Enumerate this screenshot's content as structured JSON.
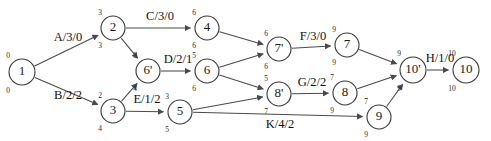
{
  "diagram": {
    "stroke_color": "#4a4a4a",
    "node_stroke_color": "#3a3a3a",
    "background_color": "#ffffff",
    "nodes": [
      {
        "id": "n1",
        "label": "1",
        "early": "0",
        "late": "0",
        "cx": 22,
        "cy": 72,
        "r": 13
      },
      {
        "id": "n2",
        "label": "2",
        "early": "3",
        "late": "3",
        "cx": 113,
        "cy": 28,
        "r": 12
      },
      {
        "id": "n3",
        "label": "3",
        "early": "2",
        "late": "4",
        "cx": 113,
        "cy": 111,
        "r": 12
      },
      {
        "id": "n6p",
        "label": "6'",
        "early": "3",
        "late": "4",
        "cx": 148,
        "cy": 71,
        "r": 12
      },
      {
        "id": "n4",
        "label": "4",
        "early": "6",
        "late": "6",
        "cx": 207,
        "cy": 28,
        "r": 12
      },
      {
        "id": "n6",
        "label": "6",
        "early": "5",
        "late": "6",
        "cx": 207,
        "cy": 71,
        "r": 12
      },
      {
        "id": "n5",
        "label": "5",
        "early": "3",
        "late": "5",
        "cx": 180,
        "cy": 112,
        "r": 12
      },
      {
        "id": "n7p",
        "label": "7'",
        "early": "6",
        "late": "6",
        "cx": 279,
        "cy": 49,
        "r": 12
      },
      {
        "id": "n8p",
        "label": "8'",
        "early": "5",
        "late": "7",
        "cx": 279,
        "cy": 94,
        "r": 12
      },
      {
        "id": "n7",
        "label": "7",
        "early": "9",
        "late": "9",
        "cx": 347,
        "cy": 45,
        "r": 12
      },
      {
        "id": "n8",
        "label": "8",
        "early": "7",
        "late": "9",
        "cx": 345,
        "cy": 93,
        "r": 12
      },
      {
        "id": "n9",
        "label": "9",
        "early": "7",
        "late": "9",
        "cx": 379,
        "cy": 117,
        "r": 12
      },
      {
        "id": "n10p",
        "label": "10'",
        "early": "9",
        "late": "9",
        "cx": 413,
        "cy": 70,
        "r": 13
      },
      {
        "id": "n10",
        "label": "10",
        "early": "10",
        "late": "10",
        "cx": 466,
        "cy": 70,
        "r": 13
      }
    ],
    "edges": [
      {
        "id": "e-a",
        "from": "n1",
        "to": "n2",
        "label": "A/3/0",
        "lx": 68,
        "ly": 41
      },
      {
        "id": "e-b",
        "from": "n1",
        "to": "n3",
        "label": "B/2/2",
        "lx": 68,
        "ly": 99
      },
      {
        "id": "e-c",
        "from": "n2",
        "to": "n4",
        "label": "C/3/0",
        "lx": 160,
        "ly": 20
      },
      {
        "id": "e-2-6p",
        "from": "n2",
        "to": "n6p",
        "label": "",
        "lx": 0,
        "ly": 0
      },
      {
        "id": "e-3-6p",
        "from": "n3",
        "to": "n6p",
        "label": "",
        "lx": 0,
        "ly": 0
      },
      {
        "id": "e-e",
        "from": "n3",
        "to": "n5",
        "label": "E/1/2",
        "lx": 147,
        "ly": 103
      },
      {
        "id": "e-d",
        "from": "n6p",
        "to": "n6",
        "label": "D/2/1",
        "lx": 178,
        "ly": 63
      },
      {
        "id": "e-4-7p",
        "from": "n4",
        "to": "n7p",
        "label": "",
        "lx": 0,
        "ly": 0
      },
      {
        "id": "e-6-7p",
        "from": "n6",
        "to": "n7p",
        "label": "",
        "lx": 0,
        "ly": 0
      },
      {
        "id": "e-6-8p",
        "from": "n6",
        "to": "n8p",
        "label": "",
        "lx": 0,
        "ly": 0
      },
      {
        "id": "e-5-8p",
        "from": "n5",
        "to": "n8p",
        "label": "",
        "lx": 0,
        "ly": 0
      },
      {
        "id": "e-f",
        "from": "n7p",
        "to": "n7",
        "label": "F/3/0",
        "lx": 313,
        "ly": 40
      },
      {
        "id": "e-g",
        "from": "n8p",
        "to": "n8",
        "label": "G/2/2",
        "lx": 312,
        "ly": 86
      },
      {
        "id": "e-k",
        "from": "n5",
        "to": "n9",
        "label": "K/4/2",
        "lx": 280,
        "ly": 128
      },
      {
        "id": "e-7-10p",
        "from": "n7",
        "to": "n10p",
        "label": "",
        "lx": 0,
        "ly": 0
      },
      {
        "id": "e-8-10p",
        "from": "n8",
        "to": "n10p",
        "label": "",
        "lx": 0,
        "ly": 0
      },
      {
        "id": "e-9-10p",
        "from": "n9",
        "to": "n10p",
        "label": "",
        "lx": 0,
        "ly": 0
      },
      {
        "id": "e-h",
        "from": "n10p",
        "to": "n10",
        "label": "H/1/0",
        "lx": 440,
        "ly": 62
      }
    ]
  }
}
